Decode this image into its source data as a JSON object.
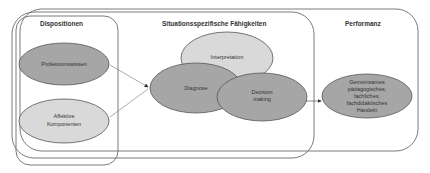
{
  "diagram": {
    "sections": {
      "dispositionen": "Dispositionen",
      "situationsspezifisch": "Situationsspezifische Fähigkeiten",
      "performanz": "Performanz"
    },
    "nodes": {
      "professionswissen": "Professionswissen",
      "affektive_1": "Affektive",
      "affektive_2": "Komponenten",
      "interpretation": "Interpretation",
      "diagnose": "Diagnose",
      "decision_1": "Decision",
      "decision_2": "making",
      "handeln_1": "Gemeinsames",
      "handeln_2": "pädagogisches,",
      "handeln_3": "fachliches,",
      "handeln_4": "fachdidaktisches",
      "handeln_5": "Handeln"
    },
    "colors": {
      "frame": "#6b6b6b",
      "ellipse_dark": "#a6a6a6",
      "ellipse_light": "#d9d9d9",
      "ellipse_stroke": "#555555",
      "arrow": "#777777"
    }
  }
}
